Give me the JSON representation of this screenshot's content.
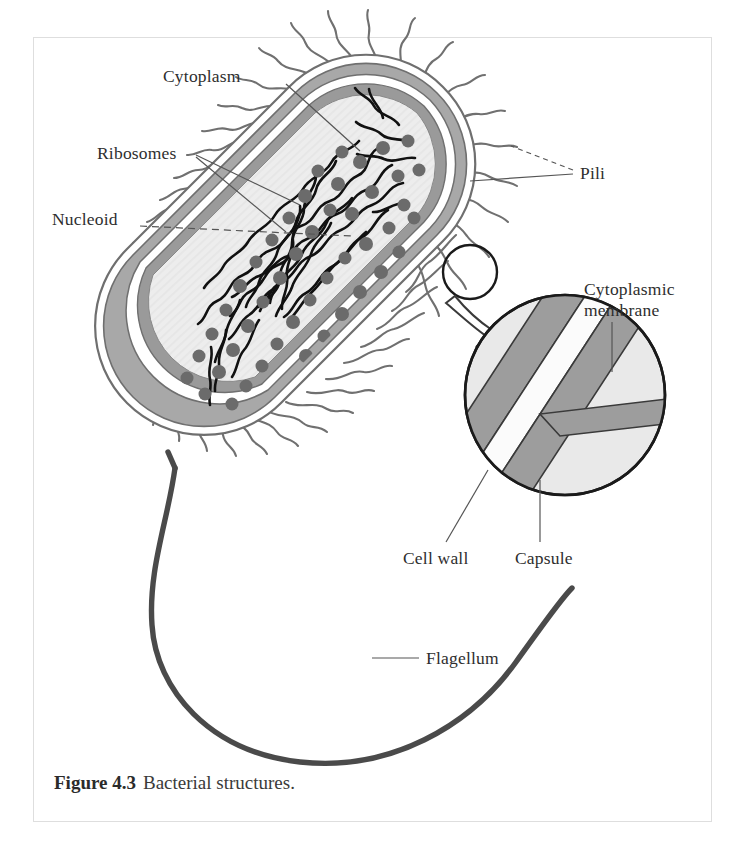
{
  "figure": {
    "number_label": "Figure 4.3",
    "caption_text": "Bacterial structures.",
    "subject": "Bacterial structures"
  },
  "labels": {
    "cytoplasm": "Cytoplasm",
    "ribosomes": "Ribosomes",
    "nucleoid": "Nucleoid",
    "pili": "Pili",
    "cytoplasmic_membrane": "Cytoplasmic membrane",
    "cell_wall": "Cell wall",
    "capsule": "Capsule",
    "flagellum": "Flagellum"
  },
  "colors": {
    "page_background": "#ffffff",
    "plate_border": "#dedede",
    "text": "#2e2e2e",
    "caption_text": "#3a3a3a",
    "cytoplasm_fill": "#ededed",
    "envelope_gray": "#9a9a9a",
    "envelope_line": "#6f6f6f",
    "capsule_gray": "#a8a8a8",
    "inset_fill": "#e9e9e9",
    "inset_band_gray": "#9d9d9d",
    "inset_band_white": "#fbfbfb",
    "ribosome_fill": "#6b6b6b",
    "nucleoid_strand": "#111111",
    "flagellum": "#4a4a4a",
    "pili_stroke": "#707070",
    "leader_line": "#555555"
  },
  "diagram": {
    "cell_shape": "rod-shaped bacillus oriented diagonally",
    "envelope_layers": [
      "capsule",
      "cell wall",
      "cytoplasmic membrane"
    ],
    "inset": {
      "type": "magnified-circle-detail",
      "bands": [
        "cytoplasmic membrane",
        "cell wall",
        "capsule"
      ],
      "callout_source": "small circle on cell envelope",
      "callout_arrow": "hollow white arrow pointing down-right"
    },
    "ribosome_count_visible": 48,
    "pili_description": "numerous short wavy hair-like projections around the entire cell",
    "flagellum_description": "single long thick tail emerging from lower-left envelope, looping down and right"
  }
}
